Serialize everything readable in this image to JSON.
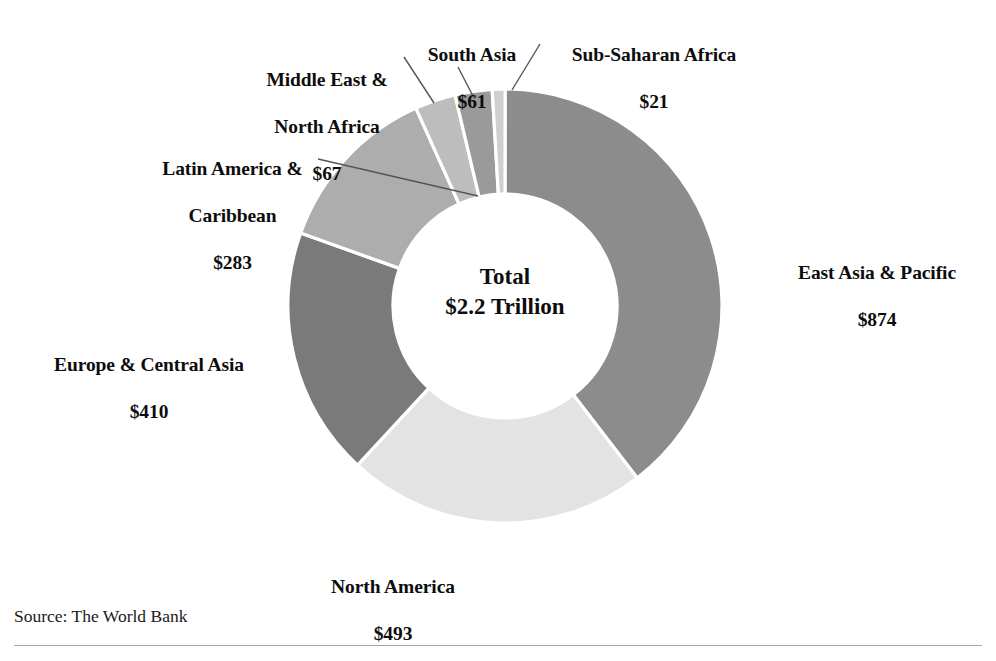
{
  "chart_data": {
    "type": "pie",
    "variant": "donut",
    "title": "",
    "subtitle": "",
    "xlabel": "",
    "ylabel": "",
    "units": "USD billions",
    "grid": false,
    "legend_position": "none",
    "label_style": "outside-callouts-with-leader-lines",
    "center_label": {
      "line1": "Total",
      "line2": "$2.2 Trillion"
    },
    "total_value": 2209,
    "total_display": "$2.2 Trillion",
    "start_angle_deg": 0,
    "direction": "clockwise",
    "categories": [
      "East Asia & Pacific",
      "North America",
      "Europe & Central Asia",
      "Latin America & Caribbean",
      "Middle East & North Africa",
      "South Asia",
      "Sub-Saharan Africa"
    ],
    "values": [
      874,
      493,
      410,
      283,
      67,
      61,
      21
    ],
    "value_labels": [
      "$874",
      "$493",
      "$410",
      "$283",
      "$67",
      "$61",
      "$21"
    ],
    "colors": [
      "#8c8c8c",
      "#e3e3e3",
      "#7a7a7a",
      "#adadad",
      "#bdbdbd",
      "#9a9a9a",
      "#cfcfcf"
    ],
    "slices": [
      {
        "id": "east-asia-pacific",
        "label": "East Asia & Pacific",
        "label_line1": "East Asia & Pacific",
        "label_line2": "",
        "value": 874,
        "value_label": "$874",
        "share_pct": 39.6,
        "color": "#8c8c8c",
        "start_deg": 0,
        "sweep_deg": 142.46,
        "has_leader": false
      },
      {
        "id": "north-america",
        "label": "North America",
        "label_line1": "North America",
        "label_line2": "",
        "value": 493,
        "value_label": "$493",
        "share_pct": 22.3,
        "color": "#e3e3e3",
        "start_deg": 142.46,
        "sweep_deg": 80.35,
        "has_leader": false
      },
      {
        "id": "europe-central-asia",
        "label": "Europe & Central Asia",
        "label_line1": "Europe & Central Asia",
        "label_line2": "",
        "value": 410,
        "value_label": "$410",
        "share_pct": 18.6,
        "color": "#7a7a7a",
        "start_deg": 222.81,
        "sweep_deg": 66.82,
        "has_leader": false
      },
      {
        "id": "latin-america-caribbean",
        "label": "Latin America & Caribbean",
        "label_line1": "Latin America &",
        "label_line2": "Caribbean",
        "value": 283,
        "value_label": "$283",
        "share_pct": 12.8,
        "color": "#adadad",
        "start_deg": 289.63,
        "sweep_deg": 46.12,
        "has_leader": true
      },
      {
        "id": "middle-east-north-africa",
        "label": "Middle East & North Africa",
        "label_line1": "Middle East &",
        "label_line2": "North Africa",
        "value": 67,
        "value_label": "$67",
        "share_pct": 3.0,
        "color": "#bdbdbd",
        "start_deg": 335.75,
        "sweep_deg": 10.92,
        "has_leader": true
      },
      {
        "id": "south-asia",
        "label": "South Asia",
        "label_line1": "South Asia",
        "label_line2": "",
        "value": 61,
        "value_label": "$61",
        "share_pct": 2.8,
        "color": "#9a9a9a",
        "start_deg": 346.67,
        "sweep_deg": 9.94,
        "has_leader": true
      },
      {
        "id": "sub-saharan-africa",
        "label": "Sub-Saharan Africa",
        "label_line1": "Sub-Saharan Africa",
        "label_line2": "",
        "value": 21,
        "value_label": "$21",
        "share_pct": 1.0,
        "color": "#cfcfcf",
        "start_deg": 356.61,
        "sweep_deg": 3.42,
        "has_leader": true
      }
    ]
  },
  "callouts": {
    "east_asia": {
      "name": "East Asia & Pacific",
      "value": "$874"
    },
    "north_america": {
      "name": "North America",
      "value": "$493"
    },
    "europe": {
      "name": "Europe & Central Asia",
      "value": "$410"
    },
    "latam": {
      "name_line1": "Latin America &",
      "name_line2": "Caribbean",
      "value": "$283"
    },
    "mena": {
      "name_line1": "Middle East &",
      "name_line2": "North Africa",
      "value": "$67"
    },
    "south_asia": {
      "name": "South Asia",
      "value": "$61"
    },
    "ssa": {
      "name": "Sub-Saharan Africa",
      "value": "$21"
    }
  },
  "center": {
    "line1": "Total",
    "line2": "$2.2 Trillion"
  },
  "footer": {
    "source": "Source: The World Bank"
  }
}
